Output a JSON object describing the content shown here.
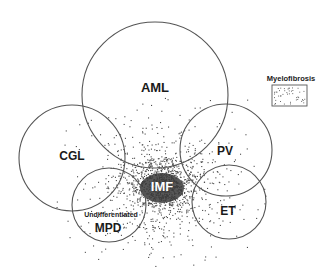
{
  "diagram": {
    "type": "venn-overlap",
    "nodes": [
      {
        "id": "aml",
        "label": "AML",
        "cx": 155,
        "cy": 95,
        "r": 73,
        "label_x": 155,
        "label_y": 92,
        "font_size": 13
      },
      {
        "id": "cgl",
        "label": "CGL",
        "cx": 72,
        "cy": 158,
        "r": 53,
        "label_x": 72,
        "label_y": 160,
        "font_size": 12
      },
      {
        "id": "pv",
        "label": "PV",
        "cx": 226,
        "cy": 150,
        "r": 46,
        "label_x": 225,
        "label_y": 155,
        "font_size": 12
      },
      {
        "id": "mpd",
        "label": "MPD",
        "sublabel": "Undifferentiated",
        "cx": 109,
        "cy": 205,
        "r": 37,
        "label_x": 108,
        "label_y": 232,
        "sublabel_x": 111,
        "sublabel_y": 217,
        "font_size": 12
      },
      {
        "id": "et",
        "label": "ET",
        "cx": 229,
        "cy": 202,
        "r": 37,
        "label_x": 228,
        "label_y": 215,
        "font_size": 12
      }
    ],
    "center": {
      "label": "IMF",
      "x": 162,
      "y": 191,
      "font_size": 13
    },
    "legend": {
      "label": "Myelofibrosis",
      "label_x": 291,
      "label_y": 81,
      "box": {
        "x": 272,
        "y": 85,
        "w": 35,
        "h": 21
      }
    }
  },
  "colors": {
    "stroke": "#555555",
    "text": "#1a1a1a",
    "dots": "#4a4a4a",
    "imf_fill": "#3a3a3a"
  }
}
